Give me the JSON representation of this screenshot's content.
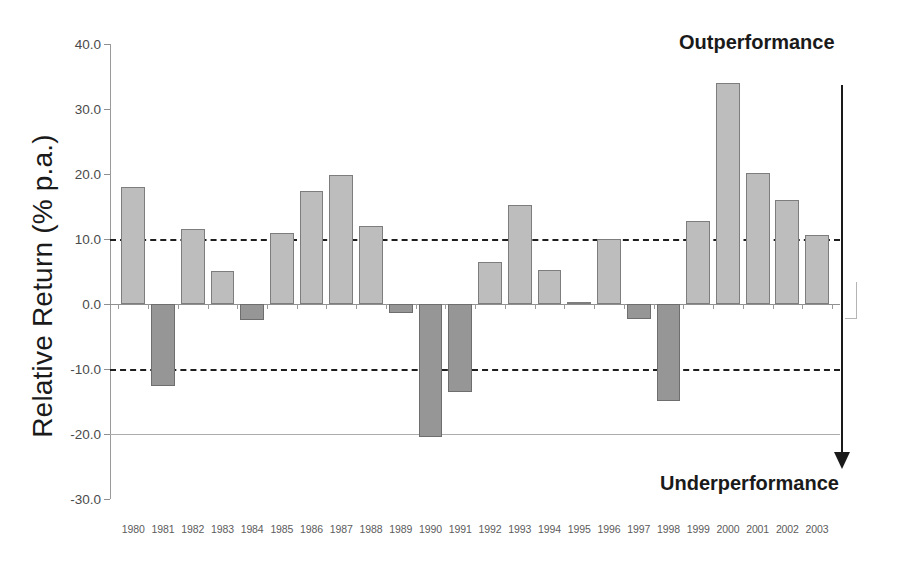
{
  "chart_data": {
    "type": "bar",
    "title": "",
    "xlabel": "",
    "ylabel": "Relative Return (% p.a.)",
    "ylim": [
      -30.0,
      40.0
    ],
    "ytick_labels": [
      "40.0",
      "30.0",
      "20.0",
      "10.0",
      "0.0",
      "-10.0",
      "-20.0",
      "-30.0"
    ],
    "ytick_values": [
      40.0,
      30.0,
      20.0,
      10.0,
      0.0,
      -10.0,
      -20.0,
      -30.0
    ],
    "grid": "dashed horizontal reference lines at +10 and -10; solid line at -20 and 0",
    "gridlines_dashed": [
      10.0,
      -10.0
    ],
    "gridlines_solid": [
      0.0,
      -20.0
    ],
    "legend": "none",
    "categories": [
      "1980",
      "1981",
      "1982",
      "1983",
      "1984",
      "1985",
      "1986",
      "1987",
      "1988",
      "1989",
      "1990",
      "1991",
      "1992",
      "1993",
      "1994",
      "1995",
      "1996",
      "1997",
      "1998",
      "1999",
      "2000",
      "2001",
      "2002",
      "2003"
    ],
    "values": [
      18.0,
      -12.6,
      11.5,
      5.1,
      -2.5,
      10.9,
      17.4,
      19.8,
      12.0,
      -1.4,
      -20.5,
      -13.5,
      6.4,
      15.3,
      5.2,
      0.3,
      10.0,
      -2.3,
      -14.9,
      12.7,
      34.0,
      20.1,
      16.0,
      10.6
    ],
    "colors": {
      "positive_fill": "#bdbdbd",
      "positive_border": "#7d7d7d",
      "negative_fill": "#969696",
      "negative_border": "#6e6e6e",
      "axis": "#8f8f8f",
      "gridline": "#1e1e1e",
      "text": "#1a1a1a",
      "tick_text": "#5c5c5c"
    },
    "annotations": [
      {
        "text": "Outperformance",
        "position": "top-right"
      },
      {
        "text": "Underperformance",
        "position": "bottom-right"
      }
    ],
    "arrow": {
      "direction": "down",
      "from_value": 36.5,
      "to_value": -20.5,
      "meaning": "axis direction from outperformance to underperformance"
    }
  }
}
